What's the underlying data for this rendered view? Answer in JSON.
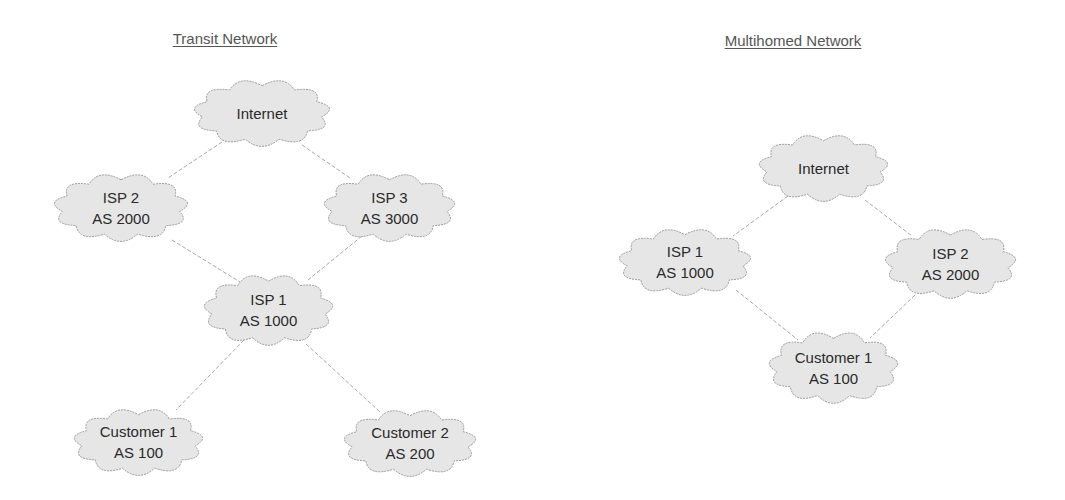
{
  "diagrams": [
    {
      "title": "Transit Network",
      "title_pos": [
        225,
        30
      ],
      "nodes": [
        {
          "id": "internet",
          "line1": "Internet",
          "line2": "",
          "box": [
            192,
            78,
            140,
            70
          ]
        },
        {
          "id": "isp2",
          "line1": "ISP 2",
          "line2": "AS 2000",
          "box": [
            52,
            172,
            138,
            71
          ]
        },
        {
          "id": "isp3",
          "line1": "ISP 3",
          "line2": "AS 3000",
          "box": [
            322,
            172,
            135,
            71
          ]
        },
        {
          "id": "isp1",
          "line1": "ISP 1",
          "line2": "AS 1000",
          "box": [
            202,
            273,
            133,
            74
          ]
        },
        {
          "id": "customer1",
          "line1": "Customer 1",
          "line2": "AS 100",
          "box": [
            72,
            407,
            133,
            70
          ]
        },
        {
          "id": "customer2",
          "line1": "Customer 2",
          "line2": "AS 200",
          "box": [
            342,
            408,
            136,
            70
          ]
        }
      ],
      "edges": [
        {
          "from": [
            222,
            142
          ],
          "to": [
            168,
            178
          ]
        },
        {
          "from": [
            302,
            145
          ],
          "to": [
            350,
            178
          ]
        },
        {
          "from": [
            172,
            240
          ],
          "to": [
            240,
            282
          ]
        },
        {
          "from": [
            362,
            236
          ],
          "to": [
            308,
            280
          ]
        },
        {
          "from": [
            244,
            340
          ],
          "to": [
            176,
            410
          ]
        },
        {
          "from": [
            306,
            344
          ],
          "to": [
            380,
            412
          ]
        }
      ]
    },
    {
      "title": "Multihomed Network",
      "title_pos": [
        793,
        32
      ],
      "nodes": [
        {
          "id": "internet",
          "line1": "Internet",
          "line2": "",
          "box": [
            757,
            133,
            133,
            70
          ]
        },
        {
          "id": "isp1",
          "line1": "ISP 1",
          "line2": "AS 1000",
          "box": [
            617,
            227,
            136,
            70
          ]
        },
        {
          "id": "isp2",
          "line1": "ISP 2",
          "line2": "AS 2000",
          "box": [
            883,
            227,
            135,
            73
          ]
        },
        {
          "id": "customer1",
          "line1": "Customer 1",
          "line2": "AS 100",
          "box": [
            767,
            330,
            133,
            75
          ]
        }
      ],
      "edges": [
        {
          "from": [
            788,
            196
          ],
          "to": [
            733,
            236
          ]
        },
        {
          "from": [
            865,
            200
          ],
          "to": [
            912,
            236
          ]
        },
        {
          "from": [
            736,
            290
          ],
          "to": [
            798,
            340
          ]
        },
        {
          "from": [
            915,
            295
          ],
          "to": [
            870,
            338
          ]
        }
      ]
    }
  ],
  "colors": {
    "cloud_fill": "#e6e6e6",
    "cloud_stroke": "#9a9a9a",
    "edge": "#a8a8a8",
    "text": "#2a2a2a",
    "title": "#555555"
  }
}
